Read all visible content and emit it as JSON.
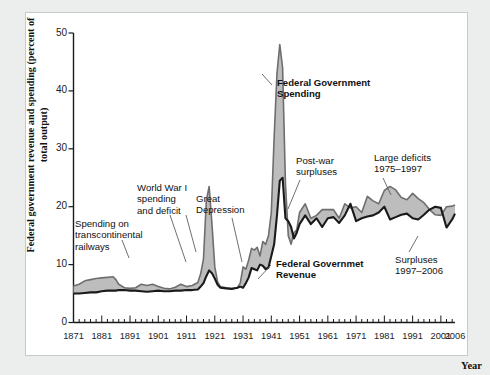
{
  "figure": {
    "background_color": "#eceded",
    "plot_background_color": "#ffffff",
    "frame_color": "#c9c9c9"
  },
  "axes": {
    "y_axis_title": "Federal government revenue and spending\n(percent of total output)",
    "x_axis_title": "Year",
    "y_ticks": [
      "0",
      "10",
      "20",
      "30",
      "40",
      "50"
    ],
    "x_ticks": [
      "1871",
      "1881",
      "1891",
      "1901",
      "1911",
      "1921",
      "1931",
      "1941",
      "1951",
      "1961",
      "1971",
      "1981",
      "1991",
      "2001",
      "2006"
    ]
  },
  "annotations": [
    {
      "id": "spending-on-railways",
      "text": "Spending on\ntranscontinental\nrailways",
      "bold": false
    },
    {
      "id": "world-war-one",
      "text": "World War I\nspending\nand deficit",
      "bold": false
    },
    {
      "id": "great-depression",
      "text": "Great\nDepression",
      "bold": false
    },
    {
      "id": "federal-government-spending",
      "text": "Federal Government\nSpending",
      "bold": true
    },
    {
      "id": "post-war-surpluses",
      "text": "Post-war\nsurpluses",
      "bold": false
    },
    {
      "id": "large-deficits",
      "text": "Large deficits\n1975–1997",
      "bold": false
    },
    {
      "id": "federal-government-revenue",
      "text": "Federal Governmet\nRevenue",
      "bold": true
    },
    {
      "id": "surpluses-1997-2006",
      "text": "Surpluses\n1997–2006",
      "bold": false
    }
  ],
  "colors": {
    "spending_line": "#6e6e6e",
    "revenue_line": "#1a1a1a",
    "gap_fill": "#b9b9b9",
    "tick_color": "#222222"
  },
  "chart_data": {
    "type": "area",
    "title": "",
    "subtitle": "",
    "xlabel": "Year",
    "ylabel": "Federal government revenue and spending (percent of total output)",
    "xlim": [
      1871,
      2006
    ],
    "ylim": [
      0,
      50
    ],
    "grid": false,
    "legend_position": "inline-annotations",
    "x": [
      1871,
      1873,
      1875,
      1877,
      1879,
      1881,
      1883,
      1885,
      1886,
      1887,
      1889,
      1891,
      1893,
      1895,
      1897,
      1899,
      1901,
      1903,
      1905,
      1907,
      1909,
      1911,
      1913,
      1915,
      1916,
      1917,
      1918,
      1919,
      1920,
      1921,
      1922,
      1923,
      1925,
      1927,
      1929,
      1930,
      1931,
      1932,
      1933,
      1934,
      1935,
      1936,
      1937,
      1938,
      1939,
      1940,
      1941,
      1942,
      1943,
      1944,
      1945,
      1946,
      1947,
      1948,
      1949,
      1950,
      1951,
      1953,
      1955,
      1957,
      1959,
      1961,
      1963,
      1965,
      1967,
      1969,
      1971,
      1973,
      1975,
      1977,
      1979,
      1981,
      1983,
      1985,
      1987,
      1989,
      1991,
      1993,
      1995,
      1997,
      1999,
      2001,
      2003,
      2005,
      2006
    ],
    "series": [
      {
        "name": "Federal Government Spending",
        "color": "#6e6e6e",
        "values": [
          6.3,
          6.6,
          7.2,
          7.4,
          7.6,
          7.7,
          7.8,
          7.9,
          7.4,
          6.6,
          6.0,
          5.9,
          6.0,
          6.6,
          6.4,
          6.6,
          6.2,
          5.9,
          5.8,
          6.1,
          6.6,
          6.2,
          6.4,
          6.9,
          8.4,
          11.0,
          21.0,
          23.5,
          17.0,
          9.6,
          7.0,
          6.2,
          6.0,
          5.9,
          6.0,
          6.8,
          9.6,
          9.2,
          10.8,
          12.8,
          12.5,
          13.0,
          11.5,
          14.0,
          13.5,
          15.0,
          19.0,
          32.0,
          43.0,
          48.0,
          44.0,
          24.0,
          15.0,
          13.5,
          15.5,
          16.0,
          19.0,
          20.5,
          18.0,
          18.5,
          19.5,
          19.5,
          19.5,
          18.0,
          20.5,
          19.8,
          20.0,
          19.0,
          21.8,
          21.0,
          20.5,
          22.8,
          23.5,
          22.9,
          21.6,
          21.2,
          22.3,
          21.4,
          20.7,
          19.5,
          18.6,
          18.5,
          20.0,
          20.1,
          20.3
        ]
      },
      {
        "name": "Federal Governmet Revenue",
        "color": "#1a1a1a",
        "values": [
          5.0,
          5.0,
          5.1,
          5.2,
          5.2,
          5.4,
          5.5,
          5.5,
          5.5,
          5.6,
          5.6,
          5.5,
          5.5,
          5.4,
          5.3,
          5.4,
          5.5,
          5.4,
          5.4,
          5.5,
          5.5,
          5.6,
          5.6,
          5.7,
          6.2,
          6.8,
          8.0,
          9.0,
          8.5,
          7.6,
          6.5,
          6.0,
          5.9,
          5.8,
          6.0,
          6.2,
          6.0,
          6.8,
          7.8,
          9.4,
          9.2,
          9.0,
          10.0,
          9.8,
          9.2,
          9.5,
          11.5,
          13.5,
          18.5,
          24.5,
          25.0,
          18.0,
          17.5,
          16.5,
          14.5,
          15.5,
          17.0,
          18.5,
          17.0,
          18.0,
          16.5,
          18.0,
          18.2,
          17.2,
          18.5,
          20.5,
          17.5,
          18.0,
          18.3,
          18.5,
          19.0,
          20.0,
          17.8,
          18.2,
          18.6,
          18.8,
          18.0,
          17.8,
          18.6,
          19.5,
          20.0,
          19.8,
          16.4,
          17.8,
          18.8
        ]
      }
    ],
    "shaded_region_meaning": "Gray fill between spending and revenue denotes deficits (spending above revenue) and surpluses"
  }
}
